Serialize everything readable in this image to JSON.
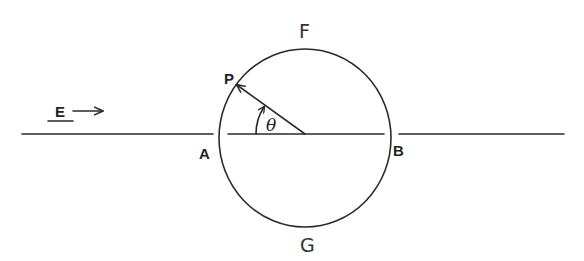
{
  "diagram": {
    "type": "physics-geometry",
    "labels": {
      "field": "E",
      "field_arrow": "→",
      "point_p": "P",
      "point_a": "A",
      "point_b": "B",
      "point_f": "F",
      "point_g": "G",
      "angle": "θ"
    },
    "geometry": {
      "circle_center": [
        304,
        136
      ],
      "circle_radius": 86,
      "axis_y": 134,
      "left_line": [
        22,
        213
      ],
      "inner_line": [
        228,
        384
      ],
      "right_line": [
        399,
        564
      ],
      "point_p": [
        234,
        82
      ]
    },
    "colors": {
      "ink": "#2a2a2a",
      "background": "#ffffff"
    }
  }
}
